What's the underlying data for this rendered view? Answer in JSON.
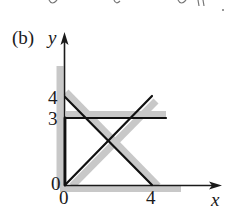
{
  "figure": {
    "panel_label": "(b)",
    "x_axis_label": "x",
    "y_axis_label": "y",
    "origin_labels": {
      "y_zero": "0",
      "x_zero": "0"
    },
    "x_ticks": [
      {
        "value": 4,
        "label": "4"
      }
    ],
    "y_ticks": [
      {
        "value": 4,
        "label": "4"
      },
      {
        "value": 3,
        "label": "3"
      }
    ],
    "colors": {
      "line": "#111111",
      "shade": "#c4c4c4",
      "axis": "#1a1a1a"
    }
  },
  "diagram": {
    "type": "linear-inequality-region",
    "elements": [
      {
        "name": "line-x-plus-y-eq-4",
        "equation": "x + y = 4",
        "from": [
          0,
          4
        ],
        "to": [
          4,
          0
        ],
        "shaded_side": "upper-right"
      },
      {
        "name": "line-y-eq-x",
        "equation": "y = x",
        "from": [
          0,
          0
        ],
        "to": [
          4,
          4
        ],
        "shaded_side": "lower-right"
      },
      {
        "name": "line-y-eq-3",
        "equation": "y = 3",
        "from": [
          0,
          3
        ],
        "to": [
          4.6,
          3
        ],
        "shaded_side": "above"
      },
      {
        "name": "line-x-eq-0",
        "equation": "x = 0",
        "from": [
          0,
          0
        ],
        "to": [
          0,
          3
        ],
        "shaded_side": "left"
      },
      {
        "name": "line-y-eq-0",
        "equation": "y = 0",
        "from": [
          0,
          0
        ],
        "to": [
          5,
          0
        ],
        "shaded_side": "below"
      }
    ]
  }
}
